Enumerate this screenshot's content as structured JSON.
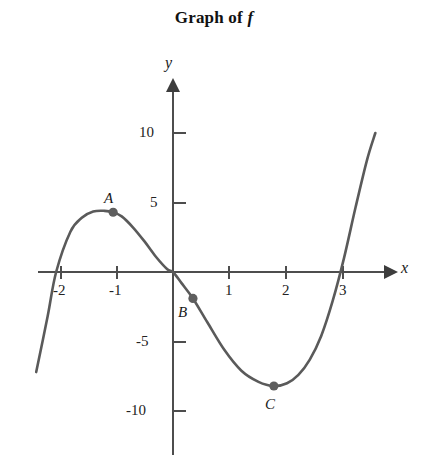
{
  "chart_data": {
    "type": "line",
    "title": "Graph of f",
    "title_prefix": "Graph of ",
    "title_function": "f",
    "xlabel": "x",
    "ylabel": "y",
    "grid": false,
    "legend": "none",
    "xlim": [
      -2.45,
      3.9
    ],
    "ylim": [
      -10.5,
      11.5
    ],
    "x_ticks": [
      -2,
      -1,
      1,
      2,
      3
    ],
    "x_tick_labels": [
      "-2",
      "-1",
      "1",
      "2",
      "3"
    ],
    "y_ticks": [
      10,
      5,
      -5,
      -10
    ],
    "y_tick_labels": [
      "10",
      "5",
      "-5",
      "-10"
    ],
    "curve_description": "cubic curve rising from lower left, local maximum near x = -1, decreasing through the origin region, local minimum near x = 1.8, then rising steeply past x = 3",
    "x_intercepts": [
      -2.05,
      0.0,
      2.8
    ],
    "series": [
      {
        "name": "f",
        "x": [
          -2.4,
          -2.2,
          -2.05,
          -1.8,
          -1.6,
          -1.4,
          -1.2,
          -1.05,
          -0.9,
          -0.7,
          -0.5,
          -0.3,
          -0.1,
          0.0,
          0.15,
          0.35,
          0.6,
          0.9,
          1.2,
          1.5,
          1.77,
          2.0,
          2.2,
          2.4,
          2.6,
          2.8,
          3.0,
          3.2,
          3.4,
          3.55
        ],
        "y": [
          -7.2,
          -3.2,
          0.0,
          2.9,
          3.9,
          4.35,
          4.4,
          4.3,
          4.0,
          3.2,
          2.2,
          1.1,
          0.2,
          0.0,
          -0.8,
          -1.9,
          -3.6,
          -5.6,
          -7.1,
          -7.9,
          -8.2,
          -8.0,
          -7.4,
          -6.3,
          -4.6,
          -2.1,
          1.0,
          4.6,
          8.0,
          10.0
        ]
      }
    ],
    "points": [
      {
        "label": "A",
        "x": -1.05,
        "y": 4.3,
        "role": "local-maximum"
      },
      {
        "label": "B",
        "x": 0.35,
        "y": -1.9,
        "role": "marked-point"
      },
      {
        "label": "C",
        "x": 1.77,
        "y": -8.2,
        "role": "local-minimum"
      }
    ],
    "colors": {
      "curve": "#5a5a5a",
      "axis": "#4d4d4d",
      "point": "#5e5e5e",
      "text": "#1a1a1a",
      "background": "#ffffff"
    }
  }
}
